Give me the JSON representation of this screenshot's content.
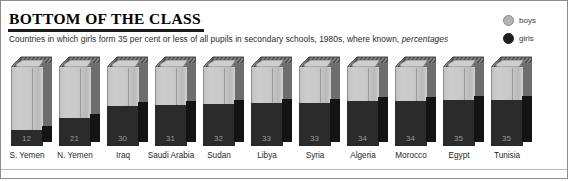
{
  "header": {
    "title": "BOTTOM OF THE CLASS",
    "subtitle_main": "Countries in which girls form 35 per cent or less of all pupils in secondary schools, 1980s, where known,",
    "subtitle_italic": "percentages"
  },
  "legend": {
    "items": [
      {
        "label": "boys",
        "color": "#b3b3b3",
        "icon": "circle-icon"
      },
      {
        "label": "girls",
        "color": "#1f1f1f",
        "icon": "circle-icon"
      }
    ]
  },
  "colors": {
    "book_front": "#c9c9c9",
    "book_side": "#6e6e6e",
    "girls_band": "#2b2b2b",
    "rule": "#1a1a1a",
    "frame_border": "#8d8d8d"
  },
  "chart_data": {
    "type": "bar",
    "title": "BOTTOM OF THE CLASS",
    "subtitle": "Countries in which girls form 35 per cent or less of all pupils in secondary schools, 1980s, where known, percentages",
    "xlabel": "",
    "ylabel": "percentage of all secondary pupils",
    "ylim": [
      0,
      100
    ],
    "grid": false,
    "legend_position": "top-right",
    "stacked": true,
    "categories": [
      "S. Yemen",
      "N. Yemen",
      "Iraq",
      "Saudi Arabia",
      "Sudan",
      "Libya",
      "Syria",
      "Algeria",
      "Morocco",
      "Egypt",
      "Tunisia"
    ],
    "series": [
      {
        "name": "girls",
        "values": [
          12,
          21,
          30,
          31,
          32,
          33,
          33,
          34,
          34,
          35,
          35
        ]
      },
      {
        "name": "boys",
        "values": [
          88,
          79,
          70,
          69,
          68,
          67,
          67,
          66,
          66,
          65,
          65
        ]
      }
    ],
    "data_labels": [
      "12",
      "21",
      "30",
      "31",
      "32",
      "33",
      "33",
      "34",
      "34",
      "35",
      "35"
    ]
  }
}
